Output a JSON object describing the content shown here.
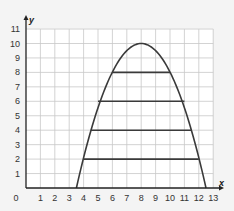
{
  "chart_data": {
    "type": "line",
    "title": "",
    "xlabel": "x",
    "ylabel": "y",
    "xlim": [
      0,
      13
    ],
    "ylim": [
      0,
      11
    ],
    "grid": true,
    "x_ticks": [
      "0",
      "1",
      "2",
      "3",
      "4",
      "5",
      "6",
      "7",
      "8",
      "9",
      "10",
      "11",
      "12",
      "13"
    ],
    "y_ticks": [
      "1",
      "2",
      "3",
      "4",
      "5",
      "6",
      "7",
      "8",
      "9",
      "10",
      "11"
    ],
    "series": [
      {
        "name": "parabola",
        "kind": "curve",
        "vertex": [
          8,
          10
        ],
        "roots": [
          3.5,
          12.5
        ],
        "equation": "y = 10 - 0.494(x - 8)^2",
        "x": [
          3.5,
          4,
          5,
          6,
          7,
          8,
          9,
          10,
          11,
          12,
          12.5
        ],
        "values": [
          0,
          2.1,
          5.6,
          8.0,
          9.5,
          10,
          9.5,
          8.0,
          5.6,
          2.1,
          0
        ]
      }
    ],
    "horizontal_segments": [
      {
        "y": 8,
        "x_start": 6,
        "x_end": 10
      },
      {
        "y": 6,
        "x_start": 5,
        "x_end": 11
      },
      {
        "y": 4,
        "x_start": 4.5,
        "x_end": 11.5
      },
      {
        "y": 2,
        "x_start": 4,
        "x_end": 12
      }
    ],
    "colors": {
      "curve": "#3a3a3a",
      "grid": "#c8c8c8",
      "axes": "#222222",
      "background": "#ffffff"
    }
  }
}
